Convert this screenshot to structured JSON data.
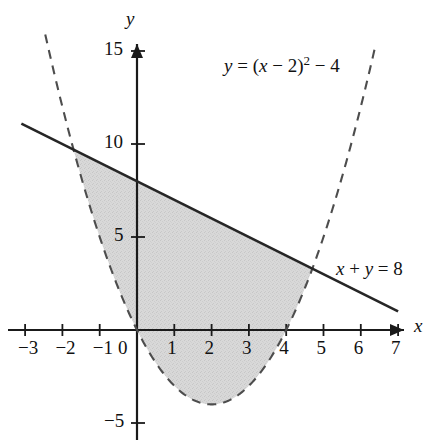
{
  "figure": {
    "title": "",
    "background_color": "#ffffff",
    "width": 432,
    "height": 448
  },
  "axes": {
    "x_axis_label": "x",
    "y_axis_label": "y",
    "origin_label": "0",
    "x_ticks": [
      "−3",
      "−2",
      "−1",
      "1",
      "2",
      "3",
      "4",
      "5",
      "6",
      "7"
    ],
    "x_tick_values": [
      -3,
      -2,
      -1,
      1,
      2,
      3,
      4,
      5,
      6,
      7
    ],
    "y_ticks": [
      "15",
      "10",
      "5",
      "−5"
    ],
    "y_tick_values": [
      15,
      10,
      5,
      -5
    ],
    "xlim": [
      -3.3,
      7.3
    ],
    "ylim": [
      -5.6,
      16.0
    ],
    "grid": false,
    "axis_color": "#1a1a1a",
    "arrow_x": true,
    "arrow_y": true
  },
  "annotations": {
    "parabola_label": {
      "text": "y = (x − 2)² − 4",
      "lhs": "y",
      "eq": "=",
      "open": "(",
      "var": "x",
      "minus1": "− 2",
      "close": ")",
      "exponent": "2",
      "minus2": "− 4",
      "x": 4.05,
      "y": 13.3
    },
    "line_label": {
      "text": "x + y = 8",
      "lhs": "x",
      "plus": "+",
      "rhs": "y",
      "eq": "=",
      "value": "8",
      "x": 5.55,
      "y": 3.9
    }
  },
  "chart_data": {
    "type": "line",
    "title": "",
    "xlabel": "x",
    "ylabel": "y",
    "xlim": [
      -3.3,
      7.3
    ],
    "ylim": [
      -5.6,
      16.0
    ],
    "grid": false,
    "legend": "inline-annotations",
    "series": [
      {
        "name": "y = (x − 2)² − 4",
        "kind": "parabola",
        "equation": "y = (x - 2)^2 - 4",
        "vertex": [
          2,
          -4
        ],
        "roots": [
          0,
          4
        ],
        "style": "dashed",
        "color": "#4d4d4d",
        "linewidth": 2,
        "x_domain": [
          -2.46,
          6.4
        ],
        "points": [
          [
            -2.46,
            15.9
          ],
          [
            -2.0,
            12.0
          ],
          [
            -1.7,
            9.69
          ],
          [
            -1.5,
            8.25
          ],
          [
            -1.0,
            5.0
          ],
          [
            -0.5,
            2.25
          ],
          [
            0.0,
            0.0
          ],
          [
            0.5,
            -1.75
          ],
          [
            1.0,
            -3.0
          ],
          [
            1.5,
            -3.75
          ],
          [
            2.0,
            -4.0
          ],
          [
            2.5,
            -3.75
          ],
          [
            3.0,
            -3.0
          ],
          [
            3.5,
            -1.75
          ],
          [
            4.0,
            0.0
          ],
          [
            4.5,
            2.25
          ],
          [
            4.7,
            3.29
          ],
          [
            5.0,
            5.0
          ],
          [
            5.5,
            8.25
          ],
          [
            6.0,
            12.0
          ],
          [
            6.4,
            15.36
          ]
        ]
      },
      {
        "name": "x + y = 8",
        "kind": "line",
        "equation": "y = 8 - x",
        "slope": -1,
        "intercept": 8,
        "style": "solid",
        "color": "#262626",
        "linewidth": 2.5,
        "x_domain": [
          -3.1,
          7.0
        ],
        "points": [
          [
            -3.1,
            11.1
          ],
          [
            7.0,
            1.0
          ]
        ]
      }
    ],
    "shaded_region": {
      "label": "region between line and parabola",
      "upper_boundary": "x + y = 8",
      "lower_boundary": "y = (x − 2)² − 4",
      "x_from": -1.7015,
      "x_to": 4.7015,
      "fill_color": "#d6d6d6",
      "opacity": 1
    },
    "intersections": [
      {
        "x": -1.7015,
        "y": 9.7015
      },
      {
        "x": 4.7015,
        "y": 3.2985
      }
    ]
  }
}
